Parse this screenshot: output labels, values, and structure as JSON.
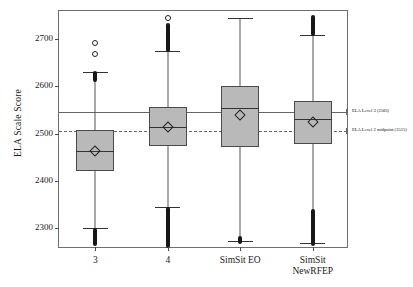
{
  "chart_data": {
    "type": "box",
    "title": "",
    "xlabel": "",
    "ylabel": "ELA Scale Score",
    "ylim": [
      2255,
      2760
    ],
    "yticks": [
      2300,
      2400,
      2500,
      2600,
      2700
    ],
    "ytick_labels": [
      "2300",
      "2400",
      "2500",
      "2600",
      "2700"
    ],
    "grid": false,
    "legend": "none",
    "categories": [
      "3",
      "4",
      "SimSit EO",
      "SimSit NewRFEP"
    ],
    "category_labels": [
      {
        "line1": "3",
        "line2": ""
      },
      {
        "line1": "4",
        "line2": ""
      },
      {
        "line1": "SimSit EO",
        "line2": ""
      },
      {
        "line1": "SimSit",
        "line2": "NewRFEP"
      }
    ],
    "boxes": [
      {
        "category": "3",
        "whisker_low": 2300,
        "q1": 2420,
        "median": 2463,
        "q3": 2508,
        "whisker_high": 2630,
        "mean": 2463,
        "outliers_high": [
          2693,
          2668
        ],
        "outlier_band_high": [
          2610,
          2632
        ],
        "outlier_band_low": [
          2262,
          2300
        ]
      },
      {
        "category": "4",
        "whisker_low": 2345,
        "q1": 2473,
        "median": 2513,
        "q3": 2557,
        "whisker_high": 2675,
        "mean": 2513,
        "outliers_high": [
          2745
        ],
        "outlier_band_high": [
          2672,
          2735
        ],
        "outlier_band_low": [
          2258,
          2345
        ]
      },
      {
        "category": "SimSit EO",
        "whisker_low": 2272,
        "q1": 2472,
        "median": 2555,
        "q3": 2600,
        "whisker_high": 2745,
        "mean": 2540,
        "outliers_high": [],
        "outlier_band_high": [],
        "outlier_band_low": [
          2265,
          2282
        ]
      },
      {
        "category": "SimSit NewRFEP",
        "whisker_low": 2268,
        "q1": 2478,
        "median": 2530,
        "q3": 2570,
        "whisker_high": 2710,
        "mean": 2525,
        "outliers_high": [],
        "outlier_band_high": [
          2708,
          2752
        ],
        "outlier_band_low": [
          2262,
          2340
        ]
      }
    ],
    "reference_lines": [
      {
        "id": "ela-level-3",
        "label": "ELA Level 3 (2583)",
        "value": 2546,
        "style": "solid",
        "color": "#666666"
      },
      {
        "id": "ela-level-2-midpoint",
        "label": "ELA Level 2 midpoint (2515)",
        "value": 2505,
        "style": "dashed",
        "color": "#666666"
      }
    ],
    "colors": {
      "box_fill": "#b9b9b9",
      "box_edge": "#4a4a4a",
      "whisker": "#555555",
      "marker": "#171717",
      "axis": "#6e6e6e",
      "reference": "#666666"
    }
  }
}
